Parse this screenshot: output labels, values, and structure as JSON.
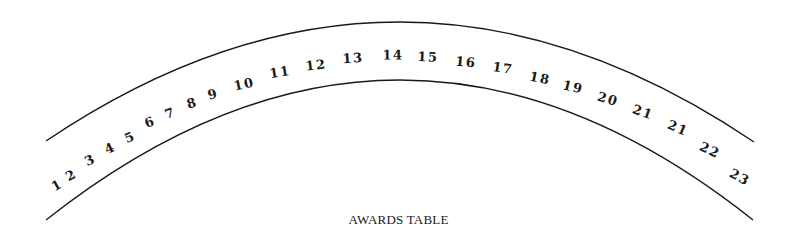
{
  "diagram": {
    "caption": "AWARDS TABLE",
    "line_color": "#1a1a1a",
    "outer_arc": {
      "start": [
        46,
        141
      ],
      "peak": [
        400,
        22
      ],
      "end": [
        754,
        142
      ]
    },
    "inner_arc": {
      "start": [
        46,
        220
      ],
      "peak": [
        400,
        80
      ],
      "end": [
        753,
        220
      ]
    },
    "seats": [
      {
        "label": "1",
        "x": 57,
        "y": 185
      },
      {
        "label": "2",
        "x": 71,
        "y": 175
      },
      {
        "label": "3",
        "x": 90,
        "y": 160
      },
      {
        "label": "4",
        "x": 110,
        "y": 148
      },
      {
        "label": "5",
        "x": 130,
        "y": 137
      },
      {
        "label": "6",
        "x": 150,
        "y": 122
      },
      {
        "label": "7",
        "x": 170,
        "y": 113
      },
      {
        "label": "8",
        "x": 192,
        "y": 103
      },
      {
        "label": "9",
        "x": 213,
        "y": 94
      },
      {
        "label": "10",
        "x": 244,
        "y": 84
      },
      {
        "label": "11",
        "x": 280,
        "y": 72
      },
      {
        "label": "12",
        "x": 316,
        "y": 65
      },
      {
        "label": "13",
        "x": 353,
        "y": 58
      },
      {
        "label": "14",
        "x": 393,
        "y": 55
      },
      {
        "label": "15",
        "x": 428,
        "y": 57
      },
      {
        "label": "16",
        "x": 466,
        "y": 62
      },
      {
        "label": "17",
        "x": 503,
        "y": 68
      },
      {
        "label": "18",
        "x": 540,
        "y": 78
      },
      {
        "label": "19",
        "x": 573,
        "y": 87
      },
      {
        "label": "20",
        "x": 608,
        "y": 99
      },
      {
        "label": "21",
        "x": 643,
        "y": 112
      },
      {
        "label": "21",
        "x": 678,
        "y": 128
      },
      {
        "label": "22",
        "x": 710,
        "y": 150
      },
      {
        "label": "23",
        "x": 740,
        "y": 177
      }
    ]
  }
}
